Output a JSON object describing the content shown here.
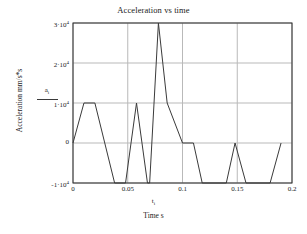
{
  "chart_data": {
    "type": "line",
    "title": "Acceleration vs time",
    "xlabel": "Time s",
    "ylabel": "Acceleration mm/s*s",
    "x_variable_label": "t",
    "x_variable_subscript": "i",
    "series_key_label": "a",
    "series_key_subscript": "i",
    "grid": true,
    "legend_position": "left-axis-key",
    "xlim": [
      0,
      0.2
    ],
    "ylim": [
      -10000,
      30000
    ],
    "xticks": [
      0,
      0.05,
      0.1,
      0.15,
      0.2
    ],
    "xtick_labels": [
      "0",
      "0.05",
      "0.1",
      "0.15",
      "0.2"
    ],
    "yticks": [
      -10000,
      0,
      10000,
      20000,
      30000
    ],
    "ytick_labels": [
      "-1·10",
      "0",
      "1·10",
      "2·10",
      "3·10"
    ],
    "ytick_exponents": [
      "4",
      "",
      "4",
      "4",
      "4"
    ],
    "line_color": "#3a3a3a",
    "grid_color": "#b9b9b9",
    "frame_color": "#2b2b2b",
    "series": [
      {
        "name": "a",
        "x": [
          0.0,
          0.01,
          0.02,
          0.038,
          0.046,
          0.048,
          0.058,
          0.068,
          0.07,
          0.078,
          0.086,
          0.1,
          0.11,
          0.118,
          0.14,
          0.148,
          0.158,
          0.18,
          0.19
        ],
        "y": [
          0,
          10000,
          10000,
          -10000,
          -10000,
          -10000,
          10000,
          -10000,
          -10000,
          30000,
          10000,
          0,
          0,
          -10000,
          -10000,
          0,
          -10000,
          -10000,
          0
        ]
      }
    ]
  },
  "plot_geometry": {
    "left": 73,
    "right": 292,
    "top": 23,
    "bottom": 183
  }
}
